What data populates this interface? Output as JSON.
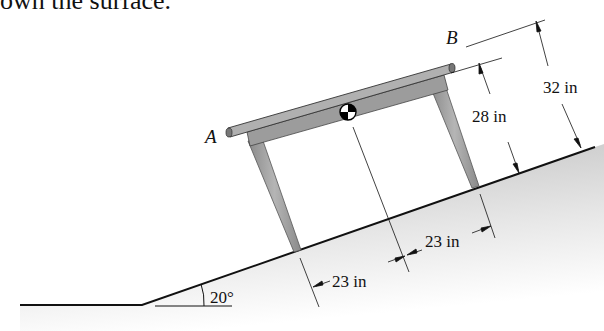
{
  "header_text": "own the surface.",
  "figure": {
    "point_a": "A",
    "point_b": "B",
    "dims": {
      "height_b": "32 in",
      "height_table": "28 in",
      "leg_spacing_left": "23 in",
      "leg_spacing_right": "23 in",
      "incline_angle": "20°"
    },
    "colors": {
      "ground": "#d4d4d4",
      "table": "#9a9a9a",
      "table_dark": "#7d7d7d",
      "line": "#111111"
    }
  }
}
